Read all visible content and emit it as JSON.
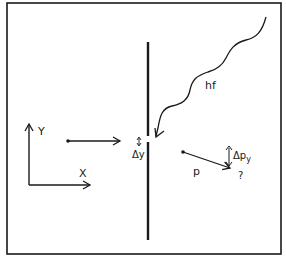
{
  "diagram": {
    "labels": {
      "axis_y": "Y",
      "axis_x": "X",
      "photon": "hf",
      "slit_width": "Δy",
      "momentum": "p",
      "momentum_uncertainty_base": "Δp",
      "momentum_uncertainty_sub": "y",
      "unknown": "?"
    },
    "colors": {
      "ink": "#1a1a1a",
      "background": "#ffffff"
    }
  }
}
